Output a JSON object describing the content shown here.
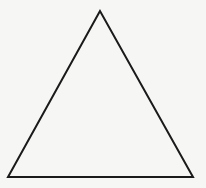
{
  "diagram": {
    "shape": "triangle",
    "kind": "equilateral-outline",
    "vertices": {
      "apex": [
        100,
        11
      ],
      "bottom_left": [
        8,
        177
      ],
      "bottom_right": [
        193,
        177
      ]
    },
    "stroke_color": "#1a1a1a",
    "stroke_width": 2,
    "fill_color": "none",
    "background_color": "#f6f6f4"
  }
}
